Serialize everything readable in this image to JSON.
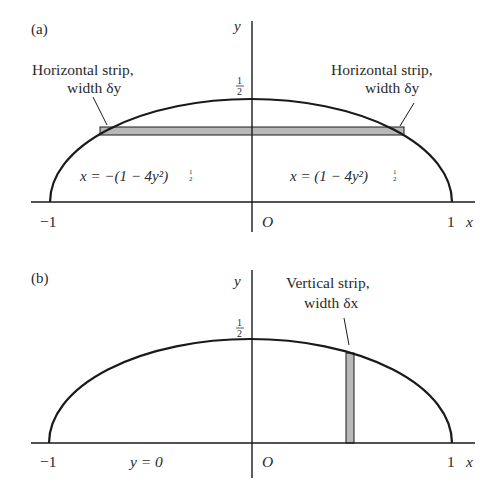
{
  "panel_a": {
    "tag": "(a)",
    "y_axis_label": "y",
    "x_axis_label": "x",
    "half_num": "1",
    "half_den": "2",
    "tick_neg1": "−1",
    "tick_1": "1",
    "origin": "O",
    "strip_left_label_line1": "Horizontal strip,",
    "strip_left_label_line2": "width δy",
    "strip_right_label_line1": "Horizontal strip,",
    "strip_right_label_line2": "width δy",
    "eq_left": "x = −(1 − 4y²)",
    "eq_right": "x = (1 − 4y²)",
    "exp_num": "1",
    "exp_den": "2"
  },
  "panel_b": {
    "tag": "(b)",
    "y_axis_label": "y",
    "x_axis_label": "x",
    "half_num": "1",
    "half_den": "2",
    "tick_neg1": "−1",
    "tick_1": "1",
    "origin": "O",
    "axis_eq": "y = 0",
    "strip_label_line1": "Vertical strip,",
    "strip_label_line2": "width δx"
  },
  "colors": {
    "ink": "#1a1a1a",
    "strip_fill": "#b8b8b8"
  }
}
